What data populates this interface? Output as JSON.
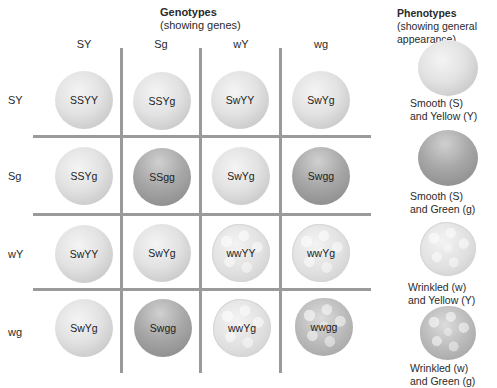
{
  "header": {
    "genotypes_title": "Genotypes",
    "genotypes_subtitle": "(showing genes)",
    "phenotypes_title": "Phenotypes",
    "phenotypes_subtitle_1": "(showing general",
    "phenotypes_subtitle_2": "appearance)"
  },
  "columns": [
    "SY",
    "Sg",
    "wY",
    "wg"
  ],
  "rows": [
    "SY",
    "Sg",
    "wY",
    "wg"
  ],
  "grid": [
    [
      "SSYY",
      "SSYg",
      "SwYY",
      "SwYg"
    ],
    [
      "SSYg",
      "SSgg",
      "SwYg",
      "Swgg"
    ],
    [
      "SwYY",
      "SwYg",
      "wwYY",
      "wwYg"
    ],
    [
      "SwYg",
      "Swgg",
      "wwYg",
      "wwgg"
    ]
  ],
  "phenotypes": [
    {
      "line1": "Smooth (S)",
      "line2": "and Yellow (Y)",
      "type": "smooth-yellow"
    },
    {
      "line1": "Smooth (S)",
      "line2": "and Green (g)",
      "type": "smooth-green"
    },
    {
      "line1": "Wrinkled (w)",
      "line2": "and Yellow (Y)",
      "type": "wrinkled-yellow"
    },
    {
      "line1": "Wrinkled (w)",
      "line2": "and Green (g)",
      "type": "wrinkled-green"
    }
  ],
  "colors": {
    "grid_line": "#9a9a9a",
    "yellow_pea": "#e2e2e2",
    "green_pea": "#a8a8a8"
  }
}
